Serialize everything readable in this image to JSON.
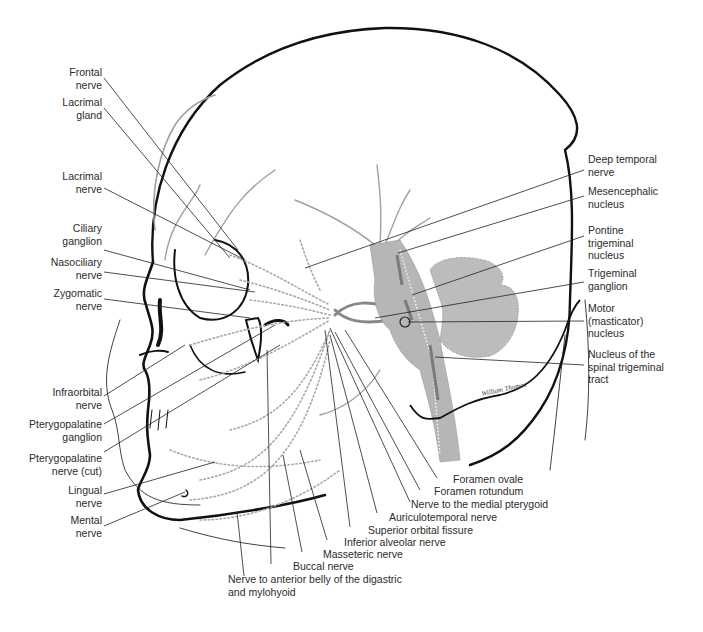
{
  "figure": {
    "signature": "William Thomas"
  },
  "labels_left": [
    {
      "id": "frontal-nerve",
      "lines": [
        "Frontal",
        "nerve"
      ]
    },
    {
      "id": "lacrimal-gland",
      "lines": [
        "Lacrimal",
        "gland"
      ]
    },
    {
      "id": "lacrimal-nerve",
      "lines": [
        "Lacrimal",
        "nerve"
      ]
    },
    {
      "id": "ciliary-ganglion",
      "lines": [
        "Ciliary",
        "ganglion"
      ]
    },
    {
      "id": "nasociliary-nerve",
      "lines": [
        "Nasociliary",
        "nerve"
      ]
    },
    {
      "id": "zygomatic-nerve",
      "lines": [
        "Zygomatic",
        "nerve"
      ]
    },
    {
      "id": "infraorbital-nerve",
      "lines": [
        "Infraorbital",
        "nerve"
      ]
    },
    {
      "id": "pterygopalatine-ganglion",
      "lines": [
        "Pterygopalatine",
        "ganglion"
      ]
    },
    {
      "id": "pterygopalatine-nerve-cut",
      "lines": [
        "Pterygopalatine",
        "nerve (cut)"
      ]
    },
    {
      "id": "lingual-nerve",
      "lines": [
        "Lingual",
        "nerve"
      ]
    },
    {
      "id": "mental-nerve",
      "lines": [
        "Mental",
        "nerve"
      ]
    }
  ],
  "labels_right": [
    {
      "id": "deep-temporal-nerve",
      "lines": [
        "Deep temporal",
        "nerve"
      ]
    },
    {
      "id": "mesencephalic-nucleus",
      "lines": [
        "Mesencephalic",
        "nucleus"
      ]
    },
    {
      "id": "pontine-trigeminal-nucleus",
      "lines": [
        "Pontine",
        "trigeminal",
        "nucleus"
      ]
    },
    {
      "id": "trigeminal-ganglion",
      "lines": [
        "Trigeminal",
        "ganglion"
      ]
    },
    {
      "id": "motor-masticator-nucleus",
      "lines": [
        "Motor",
        "(masticator)",
        "nucleus"
      ]
    },
    {
      "id": "spinal-trigeminal-nucleus",
      "lines": [
        "Nucleus of the",
        "spinal trigeminal",
        "tract"
      ]
    }
  ],
  "labels_bottom": [
    {
      "id": "foramen-ovale",
      "lines": [
        "Foramen ovale"
      ]
    },
    {
      "id": "foramen-rotundum",
      "lines": [
        "Foramen rotundum"
      ]
    },
    {
      "id": "nerve-medial-pterygoid",
      "lines": [
        "Nerve to the medial pterygoid"
      ]
    },
    {
      "id": "auriculotemporal-nerve",
      "lines": [
        "Auriculotemporal nerve"
      ]
    },
    {
      "id": "superior-orbital-fissure",
      "lines": [
        "Superior orbital fissure"
      ]
    },
    {
      "id": "inferior-alveolar-nerve",
      "lines": [
        "Inferior alveolar nerve"
      ]
    },
    {
      "id": "masseteric-nerve",
      "lines": [
        "Masseteric nerve"
      ]
    },
    {
      "id": "buccal-nerve",
      "lines": [
        "Buccal nerve"
      ]
    },
    {
      "id": "nerve-anterior-belly-digastric",
      "lines": [
        "Nerve to anterior belly of the digastric",
        "and mylohyoid"
      ]
    }
  ],
  "colors": {
    "outline": "#111111",
    "nerve_gray": "#9a9a9a",
    "brainstem_fill": "#b4b4b4",
    "leader": "#222222",
    "label_text": "#2b2b2b"
  }
}
